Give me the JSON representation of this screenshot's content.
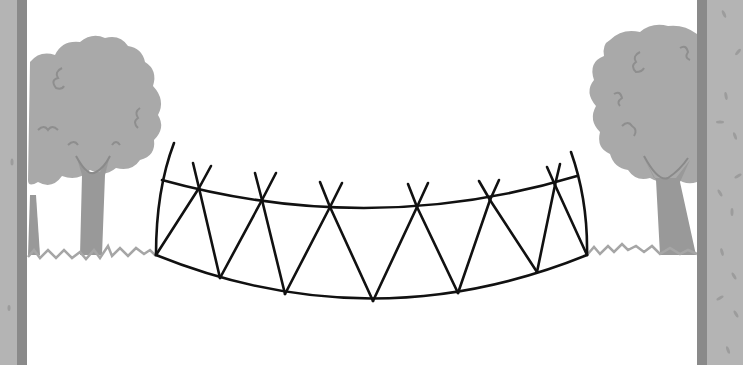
{
  "scene": {
    "title": "Curved truss bridge spanning between two walls",
    "colors": {
      "background": "#ffffff",
      "wall_face": "#b4b4b4",
      "wall_edge": "#8a8a8a",
      "wall_speck": "#9c9c9c",
      "foliage": "#a9a9a9",
      "foliage_line": "#8e8e8e",
      "trunk": "#999999",
      "grass": "#a6a6a6",
      "truss": "#111111"
    }
  },
  "walls": {
    "left": {
      "x": 0,
      "width": 28,
      "edge_x": 18,
      "edge_width": 9
    },
    "right": {
      "x": 697,
      "width": 46,
      "edge_x": 697,
      "edge_width": 10
    }
  },
  "truss": {
    "left_end": {
      "top": [
        158,
        180
      ],
      "bottom": [
        156,
        255
      ],
      "post_top": [
        172,
        143
      ]
    },
    "right_end": {
      "top": [
        577,
        176
      ],
      "bottom": [
        587,
        255
      ],
      "post_top": [
        571,
        152
      ]
    },
    "top_chord_nodes": [
      [
        199,
        188
      ],
      [
        262,
        200
      ],
      [
        330,
        207
      ],
      [
        417,
        207
      ],
      [
        490,
        200
      ],
      [
        555,
        185
      ]
    ],
    "bottom_chord_nodes": [
      [
        220,
        278
      ],
      [
        285,
        294
      ],
      [
        373,
        301
      ],
      [
        458,
        293
      ],
      [
        537,
        272
      ]
    ],
    "node_count_top": 6,
    "node_count_bottom": 5
  }
}
